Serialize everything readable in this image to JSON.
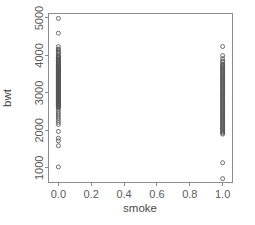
{
  "chart_data": {
    "type": "scatter",
    "title": "",
    "xlabel": "smoke",
    "ylabel": "bwt",
    "xlim": [
      -0.06,
      1.06
    ],
    "ylim": [
      620,
      5120
    ],
    "grid": false,
    "legend": "none",
    "xticks": [
      "0.0",
      "0.2",
      "0.4",
      "0.6",
      "0.8",
      "1.0"
    ],
    "xtick_values": [
      0.0,
      0.2,
      0.4,
      0.6,
      0.8,
      1.0
    ],
    "yticks": [
      "1000",
      "2000",
      "3000",
      "4000",
      "5000"
    ],
    "ytick_values": [
      1000,
      2000,
      3000,
      4000,
      5000
    ],
    "point_marker": "open-circle",
    "series": [
      {
        "name": "smoke = 0",
        "x": 0,
        "count": 115,
        "values": [
          4990,
          4593,
          4238,
          4174,
          4153,
          4111,
          4082,
          4054,
          3997,
          3983,
          3955,
          3941,
          3920,
          3884,
          3870,
          3860,
          3856,
          3827,
          3799,
          3790,
          3770,
          3756,
          3742,
          3714,
          3700,
          3685,
          3671,
          3657,
          3643,
          3629,
          3615,
          3600,
          3586,
          3572,
          3558,
          3544,
          3530,
          3515,
          3501,
          3487,
          3473,
          3459,
          3445,
          3430,
          3416,
          3402,
          3388,
          3374,
          3360,
          3345,
          3331,
          3317,
          3303,
          3289,
          3275,
          3260,
          3246,
          3232,
          3218,
          3204,
          3190,
          3175,
          3161,
          3147,
          3133,
          3119,
          3105,
          3090,
          3076,
          3062,
          3048,
          3034,
          3020,
          3005,
          2991,
          2977,
          2963,
          2949,
          2935,
          2920,
          2906,
          2892,
          2878,
          2864,
          2850,
          2835,
          2821,
          2807,
          2793,
          2779,
          2765,
          2750,
          2736,
          2722,
          2708,
          2694,
          2680,
          2665,
          2651,
          2637,
          2623,
          2600,
          2551,
          2495,
          2438,
          2381,
          2325,
          2268,
          2211,
          2155,
          1970,
          1790,
          1720,
          1588,
          1021
        ]
      },
      {
        "name": "smoke = 1",
        "x": 1,
        "count": 74,
        "values": [
          4238,
          3997,
          3912,
          3856,
          3827,
          3770,
          3742,
          3714,
          3685,
          3657,
          3629,
          3600,
          3572,
          3544,
          3515,
          3487,
          3459,
          3430,
          3402,
          3374,
          3345,
          3317,
          3289,
          3260,
          3232,
          3204,
          3175,
          3147,
          3119,
          3090,
          3062,
          3034,
          3005,
          2977,
          2949,
          2920,
          2892,
          2864,
          2835,
          2807,
          2779,
          2750,
          2722,
          2694,
          2665,
          2637,
          2608,
          2580,
          2551,
          2523,
          2495,
          2466,
          2438,
          2410,
          2381,
          2353,
          2325,
          2296,
          2268,
          2240,
          2211,
          2183,
          2155,
          2126,
          2098,
          2070,
          2041,
          2013,
          1984,
          1956,
          1928,
          1899,
          1135,
          709
        ]
      }
    ]
  },
  "colors": {
    "axis": "#8c8c8c",
    "text": "#4a4a4a",
    "point_stroke": "#555555",
    "background": "#ffffff"
  }
}
